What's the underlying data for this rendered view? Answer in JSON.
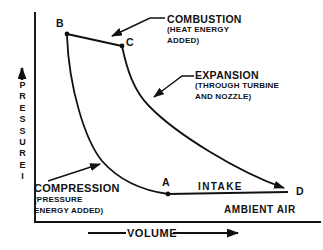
{
  "diagram": {
    "background": "#ffffff",
    "ink": "#111111",
    "y_axis": {
      "label": "PRESSURE",
      "tail_mark": "I"
    },
    "x_axis": {
      "label": "VOLUME"
    },
    "points": {
      "a": "A",
      "b": "B",
      "c": "C",
      "d": "D"
    },
    "processes": {
      "combustion": {
        "name": "COMBUSTION",
        "note": "(HEAT ENERGY\nADDED)"
      },
      "expansion": {
        "name": "EXPANSION",
        "note": "(THROUGH TURBINE\nAND NOZZLE)"
      },
      "compression": {
        "name": "COMPRESSION",
        "note": "(PRESSURE\nENERGY ADDED)"
      },
      "intake": {
        "name": "INTAKE"
      }
    },
    "ambient_air": "AMBIENT AIR"
  }
}
